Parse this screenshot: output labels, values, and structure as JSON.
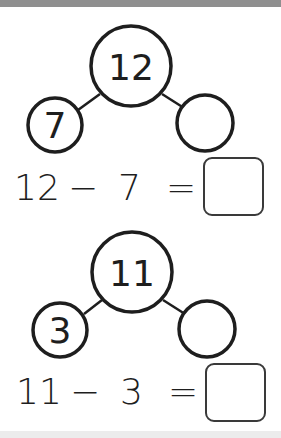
{
  "problems": [
    {
      "whole": "12",
      "part_known": "7",
      "part_unknown": "",
      "equation": {
        "left": "12",
        "operator": "−",
        "right": "7",
        "equals": "=",
        "answer": ""
      }
    },
    {
      "whole": "11",
      "part_known": "3",
      "part_unknown": "",
      "equation": {
        "left": "11",
        "operator": "−",
        "right": "3",
        "equals": "=",
        "answer": ""
      }
    }
  ],
  "colors": {
    "stroke": "#1e1e1e",
    "top_bar": "#8f8f8f",
    "bottom_bar": "#ececec"
  }
}
